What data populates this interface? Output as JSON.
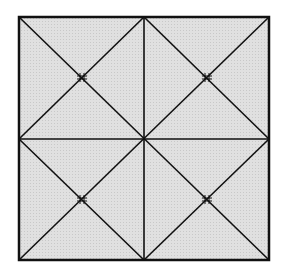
{
  "diagram": {
    "fill_color": "#dcdcdc",
    "stroke_color": "#111111",
    "square": {
      "x": 19,
      "y": 17,
      "width": 250,
      "height": 243
    },
    "quadrants": 4,
    "marks": [
      {
        "label": "tick-mark-top-left"
      },
      {
        "label": "tick-mark-top-right"
      },
      {
        "label": "tick-mark-bottom-left"
      },
      {
        "label": "tick-mark-bottom-right"
      }
    ]
  }
}
